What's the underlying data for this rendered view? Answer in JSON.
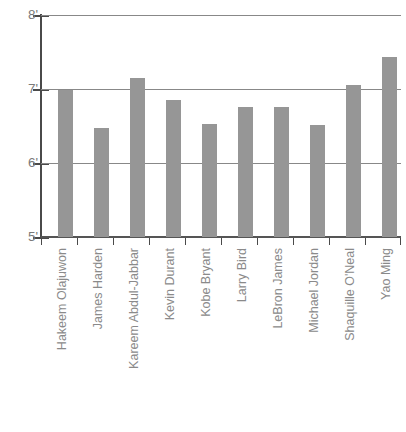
{
  "chart_data": {
    "type": "bar",
    "title": "",
    "subtitle": "",
    "xlabel": "",
    "ylabel": "",
    "ylim": [
      5,
      8
    ],
    "ytick_labels": [
      "8'",
      "7'",
      "6'",
      "5'"
    ],
    "ytick_values": [
      8,
      7,
      6,
      5
    ],
    "grid": true,
    "legend": false,
    "bar_color": "#969696",
    "categories": [
      "Hakeem Olajuwon",
      "James Harden",
      "Kareem Abdul-Jabbar",
      "Kevin Durant",
      "Kobe Bryant",
      "Larry Bird",
      "LeBron James",
      "Michael Jordan",
      "Shaquille O'Neal",
      "Yao Ming"
    ],
    "values": [
      6.98,
      6.47,
      7.15,
      6.85,
      6.53,
      6.76,
      6.76,
      6.52,
      7.05,
      7.43
    ],
    "series": [
      {
        "name": "Height",
        "values": [
          6.98,
          6.47,
          7.15,
          6.85,
          6.53,
          6.76,
          6.76,
          6.52,
          7.05,
          7.43
        ]
      }
    ]
  },
  "axis": {
    "y_labels": [
      "8'",
      "7'",
      "6'",
      "5'"
    ]
  }
}
